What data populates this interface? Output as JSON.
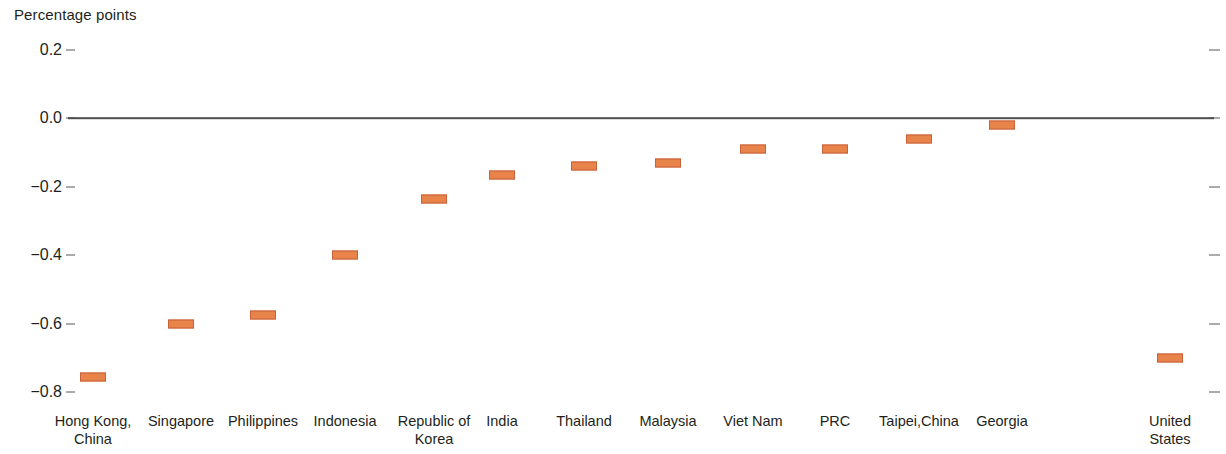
{
  "chart_data": {
    "type": "scatter",
    "title": "",
    "subtitle": "",
    "ylabel": "Percentage points",
    "xlabel": "",
    "ylim": [
      -0.8,
      0.2
    ],
    "yticks": [
      0.2,
      0.0,
      -0.2,
      -0.4,
      -0.6,
      -0.8
    ],
    "ytick_labels": [
      "0.2",
      "0.0",
      "−0.2",
      "−0.4",
      "−0.6",
      "−0.8"
    ],
    "grid": false,
    "legend": "none",
    "zero_line": 0.0,
    "marker_style": "horizontal-bar",
    "marker_color": "#e8834a",
    "marker_border_color": "#c8603a",
    "categories": [
      "Hong Kong,\nChina",
      "Singapore",
      "Philippines",
      "Indonesia",
      "Republic of\nKorea",
      "India",
      "Thailand",
      "Malaysia",
      "Viet Nam",
      "PRC",
      "Taipei,China",
      "Georgia",
      "United States"
    ],
    "values": [
      -0.755,
      -0.6,
      -0.575,
      -0.4,
      -0.235,
      -0.165,
      -0.14,
      -0.13,
      -0.09,
      -0.09,
      -0.06,
      -0.02,
      -0.7
    ]
  }
}
